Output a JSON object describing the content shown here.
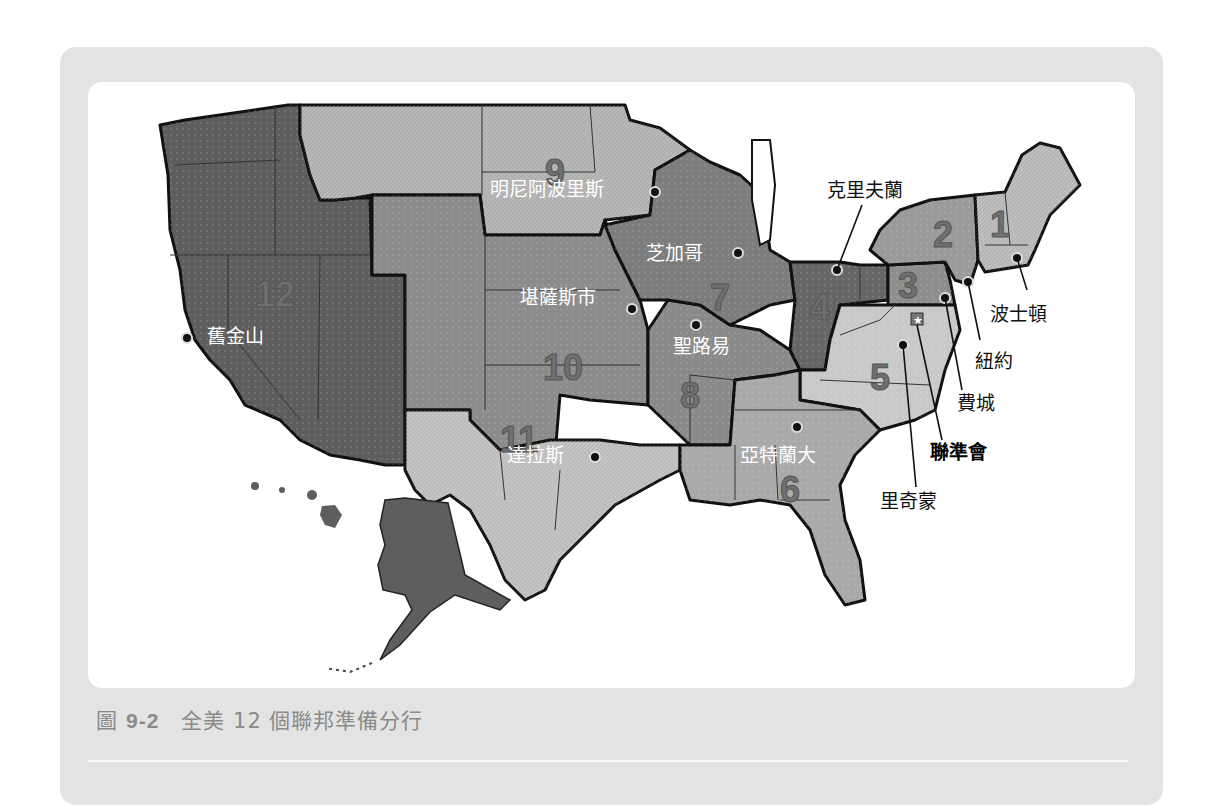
{
  "figure": {
    "number": "9-2",
    "prefix": "圖",
    "title": "全美 12 個聯邦準備分行"
  },
  "colors": {
    "outer_panel": "#e3e3e3",
    "inner_panel": "#ffffff",
    "caption_text": "#8a8a8a",
    "district_dark": "#5e5e5e",
    "district_mid": "#8a8a8a",
    "district_light": "#b4b4b4",
    "district_lighter": "#c8c8c8",
    "border": "#111111"
  },
  "districts": [
    {
      "number": "1",
      "city": "波士頓"
    },
    {
      "number": "2",
      "city": "紐約"
    },
    {
      "number": "3",
      "city": "費城"
    },
    {
      "number": "4",
      "city": "克里夫蘭"
    },
    {
      "number": "5",
      "city": "里奇蒙"
    },
    {
      "number": "6",
      "city": "亞特蘭大"
    },
    {
      "number": "7",
      "city": "芝加哥"
    },
    {
      "number": "8",
      "city": "聖路易"
    },
    {
      "number": "9",
      "city": "明尼阿波里斯"
    },
    {
      "number": "10",
      "city": "堪薩斯市"
    },
    {
      "number": "11",
      "city": "達拉斯"
    },
    {
      "number": "12",
      "city": "舊金山"
    }
  ],
  "headquarters": {
    "label": "聯準會",
    "icon": "star-icon"
  }
}
